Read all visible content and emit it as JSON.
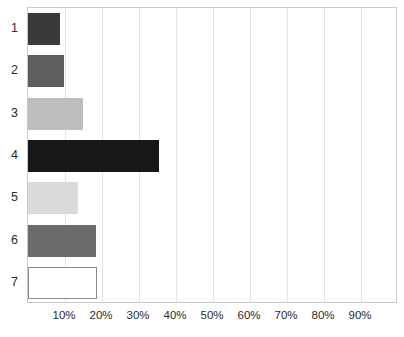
{
  "chart_data": {
    "type": "bar",
    "orientation": "horizontal",
    "title": "",
    "subtitle": "",
    "xlabel": "",
    "ylabel": "",
    "categories": [
      "1",
      "2",
      "3",
      "4",
      "5",
      "6",
      "7"
    ],
    "values": [
      8.7,
      9.8,
      14.9,
      35.5,
      13.6,
      18.4,
      18.7
    ],
    "value_suffix": "%",
    "xlim": [
      0,
      100
    ],
    "ylim": [
      0,
      7
    ],
    "xticks": [
      10,
      20,
      30,
      40,
      50,
      60,
      70,
      80,
      90
    ],
    "xticklabels": [
      "10%",
      "20%",
      "30%",
      "40%",
      "50%",
      "60%",
      "70%",
      "80%",
      "90%"
    ],
    "grid": true,
    "grid_axis": "x",
    "legend": false,
    "legend_position": "none",
    "bar_colors": [
      "#3a3a3a",
      "#5e5e5e",
      "#bdbdbd",
      "#171717",
      "#d9d9d9",
      "#6b6b6b",
      "#ffffff"
    ],
    "bar_border_colors": [
      "#3a3a3a",
      "#5e5e5e",
      "#bdbdbd",
      "#171717",
      "#d9d9d9",
      "#6b6b6b",
      "#8a8a8a"
    ],
    "series": [
      {
        "name": "series-1",
        "values": [
          8.7,
          9.8,
          14.9,
          35.5,
          13.6,
          18.4,
          18.7
        ]
      }
    ]
  },
  "axes": {
    "frame_color": "#c9c9c9",
    "gridline_color": "#e3e3e3",
    "tick_label_color": "#2b2b2b",
    "category_label_color": "#2b2b2b"
  },
  "canvas": {
    "background": "#ffffff",
    "width": 404,
    "height": 337
  }
}
